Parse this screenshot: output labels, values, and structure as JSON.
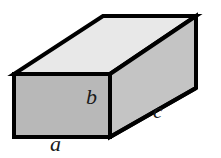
{
  "figure": {
    "name": "rectangular-box",
    "background_color": "#ffffff",
    "stroke_color": "#000000",
    "stroke_width": 4,
    "faces": {
      "top": {
        "name": "top-face",
        "fill": "#e8e8e8"
      },
      "front": {
        "name": "front-face",
        "fill": "#b8b8b8"
      },
      "right": {
        "name": "right-face",
        "fill": "#c4c4c4"
      }
    },
    "labels": [
      {
        "id": "a",
        "text": "a",
        "meaning": "width",
        "edge": "front-bottom"
      },
      {
        "id": "b",
        "text": "b",
        "meaning": "height",
        "edge": "front-right-vertical"
      },
      {
        "id": "c",
        "text": "c",
        "meaning": "depth",
        "edge": "right-bottom"
      }
    ],
    "vertices": {
      "front_top_left": [
        14,
        74
      ],
      "front_top_right": [
        110,
        74
      ],
      "front_bottom_left": [
        14,
        137
      ],
      "front_bottom_right": [
        110,
        137
      ],
      "back_top_left": [
        103,
        16
      ],
      "back_top_right": [
        196,
        16
      ],
      "back_bottom_right": [
        196,
        88
      ]
    },
    "label_text": {
      "a": "a",
      "b": "b",
      "c": "c"
    }
  }
}
